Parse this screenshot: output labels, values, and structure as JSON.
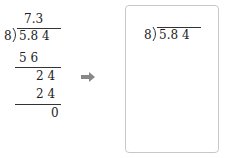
{
  "worked_example": {
    "divisor": "8",
    "dividend": "5.8 4",
    "quotient": "7.3",
    "steps": [
      {
        "value": "5 6",
        "type": "subtract"
      },
      {
        "value": "2 4",
        "type": "remainder"
      },
      {
        "value": "2 4",
        "type": "subtract"
      },
      {
        "value": "0",
        "type": "remainder"
      }
    ]
  },
  "arrow": {
    "icon": "right-arrow-icon",
    "color": "#888888"
  },
  "answer_box": {
    "divisor": "8",
    "dividend": "5.8 4",
    "border_color": "#c8c8c8"
  }
}
